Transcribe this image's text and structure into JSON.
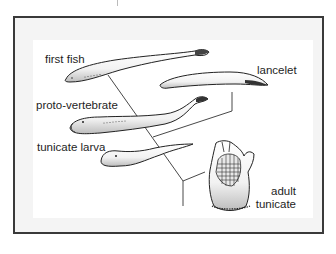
{
  "diagram": {
    "title": "",
    "labels": {
      "first_fish": "first fish",
      "lancelet": "lancelet",
      "proto_vertebrate": "proto-vertebrate",
      "tunicate_larva": "tunicate larva",
      "adult_tunicate_line1": "adult",
      "adult_tunicate_line2": "tunicate"
    },
    "organisms": [
      {
        "id": "first-fish",
        "label": "first fish"
      },
      {
        "id": "lancelet",
        "label": "lancelet"
      },
      {
        "id": "proto-vertebrate",
        "label": "proto-vertebrate"
      },
      {
        "id": "tunicate-larva",
        "label": "tunicate larva"
      },
      {
        "id": "adult-tunicate",
        "label": "adult tunicate"
      }
    ],
    "colors": {
      "frame_border": "#3a3a3a",
      "frame_bg": "#f4f4f4",
      "panel_bg": "#ffffff",
      "ink": "#1e1e1e"
    }
  }
}
